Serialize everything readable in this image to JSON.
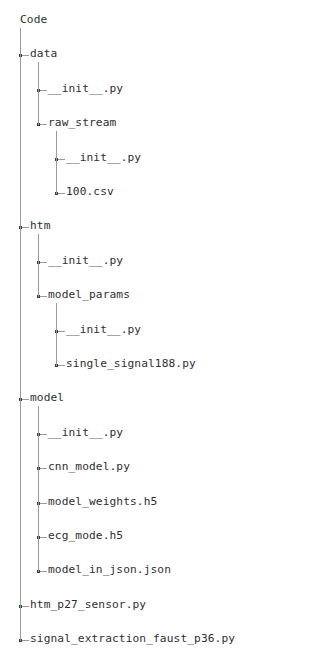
{
  "view": {
    "title": "project-file-tree",
    "text_color": "#2f2f2f",
    "line_color": "#9a9a9a",
    "knot_color": "#3a3a3a",
    "background": "#ffffff"
  },
  "tree": {
    "root_label": "Code",
    "nodes": [
      {
        "label": "Code",
        "depth": 0,
        "kind": "folder",
        "last": false
      },
      {
        "label": "data",
        "depth": 1,
        "kind": "folder",
        "last": false
      },
      {
        "label": "__init__.py",
        "depth": 2,
        "kind": "file",
        "last": false
      },
      {
        "label": "raw_stream",
        "depth": 2,
        "kind": "folder",
        "last": true
      },
      {
        "label": "__init__.py",
        "depth": 3,
        "kind": "file",
        "last": false
      },
      {
        "label": "100.csv",
        "depth": 3,
        "kind": "file",
        "last": true
      },
      {
        "label": "htm",
        "depth": 1,
        "kind": "folder",
        "last": false
      },
      {
        "label": "__init__.py",
        "depth": 2,
        "kind": "file",
        "last": false
      },
      {
        "label": "model_params",
        "depth": 2,
        "kind": "folder",
        "last": true
      },
      {
        "label": "__init__.py",
        "depth": 3,
        "kind": "file",
        "last": false
      },
      {
        "label": "single_signal188.py",
        "depth": 3,
        "kind": "file",
        "last": true
      },
      {
        "label": "model",
        "depth": 1,
        "kind": "folder",
        "last": false
      },
      {
        "label": "__init__.py",
        "depth": 2,
        "kind": "file",
        "last": false
      },
      {
        "label": "cnn_model.py",
        "depth": 2,
        "kind": "file",
        "last": false
      },
      {
        "label": "model_weights.h5",
        "depth": 2,
        "kind": "file",
        "last": false
      },
      {
        "label": "ecg_mode.h5",
        "depth": 2,
        "kind": "file",
        "last": false
      },
      {
        "label": "model_in_json.json",
        "depth": 2,
        "kind": "file",
        "last": true
      },
      {
        "label": "htm_p27_sensor.py",
        "depth": 1,
        "kind": "file",
        "last": false
      },
      {
        "label": "signal_extraction_faust_p36.py",
        "depth": 1,
        "kind": "file",
        "last": true
      }
    ]
  }
}
